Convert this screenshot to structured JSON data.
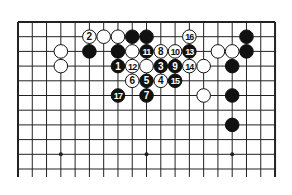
{
  "diagram": {
    "type": "go-board-partial",
    "columns": 19,
    "rows_shown": 11,
    "edges": [
      "top",
      "left",
      "right"
    ],
    "star_points": [
      [
        3,
        9
      ],
      [
        9,
        9
      ],
      [
        15,
        9
      ]
    ],
    "colors": {
      "black": "#111111",
      "white": "#ffffff",
      "line": "#222222"
    },
    "stones": [
      {
        "c": 5,
        "r": 1,
        "color": "white",
        "label": "2"
      },
      {
        "c": 6,
        "r": 1,
        "color": "white",
        "label": ""
      },
      {
        "c": 7,
        "r": 1,
        "color": "white",
        "label": ""
      },
      {
        "c": 8,
        "r": 1,
        "color": "black",
        "label": ""
      },
      {
        "c": 9,
        "r": 1,
        "color": "black",
        "label": ""
      },
      {
        "c": 12,
        "r": 1,
        "color": "white",
        "label": "16"
      },
      {
        "c": 16,
        "r": 1,
        "color": "black",
        "label": ""
      },
      {
        "c": 3,
        "r": 2,
        "color": "white",
        "label": ""
      },
      {
        "c": 5,
        "r": 2,
        "color": "black",
        "label": ""
      },
      {
        "c": 7,
        "r": 2,
        "color": "black",
        "label": ""
      },
      {
        "c": 8,
        "r": 2,
        "color": "white",
        "label": ""
      },
      {
        "c": 9,
        "r": 2,
        "color": "black",
        "label": "11"
      },
      {
        "c": 10,
        "r": 2,
        "color": "white",
        "label": "8"
      },
      {
        "c": 11,
        "r": 2,
        "color": "white",
        "label": "10"
      },
      {
        "c": 12,
        "r": 2,
        "color": "black",
        "label": "13"
      },
      {
        "c": 14,
        "r": 2,
        "color": "white",
        "label": ""
      },
      {
        "c": 15,
        "r": 2,
        "color": "white",
        "label": ""
      },
      {
        "c": 16,
        "r": 2,
        "color": "black",
        "label": ""
      },
      {
        "c": 3,
        "r": 3,
        "color": "white",
        "label": ""
      },
      {
        "c": 7,
        "r": 3,
        "color": "black",
        "label": "1"
      },
      {
        "c": 8,
        "r": 3,
        "color": "white",
        "label": "12"
      },
      {
        "c": 9,
        "r": 3,
        "color": "white",
        "label": ""
      },
      {
        "c": 10,
        "r": 3,
        "color": "black",
        "label": "3"
      },
      {
        "c": 11,
        "r": 3,
        "color": "black",
        "label": "9"
      },
      {
        "c": 12,
        "r": 3,
        "color": "white",
        "label": "14"
      },
      {
        "c": 13,
        "r": 3,
        "color": "white",
        "label": ""
      },
      {
        "c": 15,
        "r": 3,
        "color": "black",
        "label": ""
      },
      {
        "c": 8,
        "r": 4,
        "color": "white",
        "label": "6"
      },
      {
        "c": 9,
        "r": 4,
        "color": "black",
        "label": "5"
      },
      {
        "c": 10,
        "r": 4,
        "color": "white",
        "label": "4"
      },
      {
        "c": 11,
        "r": 4,
        "color": "black",
        "label": "15"
      },
      {
        "c": 7,
        "r": 5,
        "color": "black",
        "label": "17"
      },
      {
        "c": 9,
        "r": 5,
        "color": "black",
        "label": "7"
      },
      {
        "c": 13,
        "r": 5,
        "color": "white",
        "label": ""
      },
      {
        "c": 15,
        "r": 5,
        "color": "black",
        "label": ""
      },
      {
        "c": 15,
        "r": 7,
        "color": "black",
        "label": ""
      }
    ]
  }
}
